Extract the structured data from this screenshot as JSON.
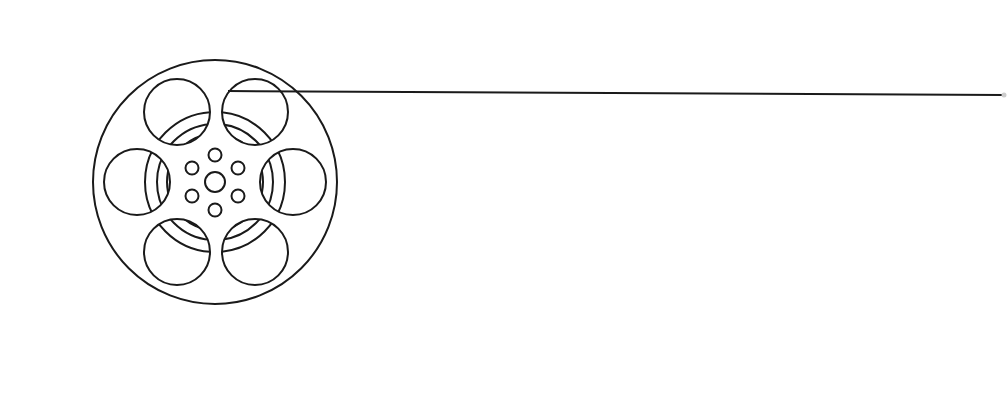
{
  "graphic": {
    "subject": "film-reel",
    "description": "Line-art film reel with film strip extending to the right",
    "colors": {
      "background": "#ffffff",
      "stroke": "#1a1a1a"
    },
    "reel": {
      "center": [
        215,
        182
      ],
      "outer_radius": 122,
      "hub_radius": 10,
      "small_holes": {
        "count": 6,
        "ring_radius": 28,
        "radius": 6
      },
      "large_holes": {
        "count": 6,
        "radius": 34
      }
    },
    "film_strip": {
      "start": [
        228,
        91
      ],
      "end": [
        1003,
        95
      ]
    }
  }
}
